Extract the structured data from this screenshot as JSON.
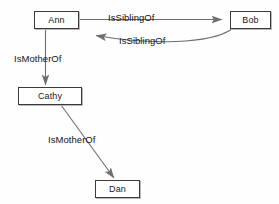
{
  "diagram": {
    "type": "directed-graph",
    "background_color": "#fefefe",
    "node_fill": "#ffffff",
    "node_border_color": "#3a3a3a",
    "edge_color": "#6e6e6e",
    "text_color": "#151515",
    "nodes": [
      {
        "id": "ann",
        "label": "Ann",
        "x": 34,
        "y": 11,
        "w": 45,
        "h": 18
      },
      {
        "id": "bob",
        "label": "Bob",
        "x": 230,
        "y": 11,
        "w": 41,
        "h": 18
      },
      {
        "id": "cathy",
        "label": "Cathy",
        "x": 18,
        "y": 87,
        "w": 64,
        "h": 18
      },
      {
        "id": "dan",
        "label": "Dan",
        "x": 95,
        "y": 180,
        "w": 45,
        "h": 18
      }
    ],
    "edges": [
      {
        "id": "ann-bob",
        "from": "ann",
        "to": "bob",
        "label": "IsSiblingOf",
        "label_x": 108,
        "label_y": 13
      },
      {
        "id": "bob-ann",
        "from": "bob",
        "to": "ann",
        "label": "IsSiblingOf",
        "label_x": 119,
        "label_y": 36
      },
      {
        "id": "ann-cathy",
        "from": "ann",
        "to": "cathy",
        "label": "IsMotherOf",
        "label_x": 14,
        "label_y": 54
      },
      {
        "id": "cathy-dan",
        "from": "cathy",
        "to": "dan",
        "label": "IsMotherOf",
        "label_x": 48,
        "label_y": 135
      }
    ]
  }
}
